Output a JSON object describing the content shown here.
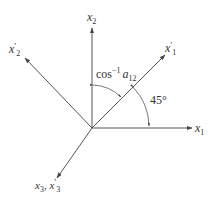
{
  "diagram": {
    "title": "",
    "axes": [
      {
        "id": "x1",
        "label": "x",
        "sub": "1",
        "prime": false
      },
      {
        "id": "x2",
        "label": "x",
        "sub": "2",
        "prime": false
      },
      {
        "id": "x1p",
        "label": "x",
        "sub": "1",
        "prime": true
      },
      {
        "id": "x2p",
        "label": "x",
        "sub": "2",
        "prime": true
      },
      {
        "id": "x3",
        "label": "x",
        "sub": "3",
        "label2": "x",
        "sub2": "3",
        "sep": ", "
      }
    ],
    "angle_labels": {
      "cos_text": "cos",
      "cos_sup": "−1",
      "cos_var": "a",
      "cos_sub": "12",
      "angle_45": "45°"
    },
    "prime_mark": "′"
  }
}
